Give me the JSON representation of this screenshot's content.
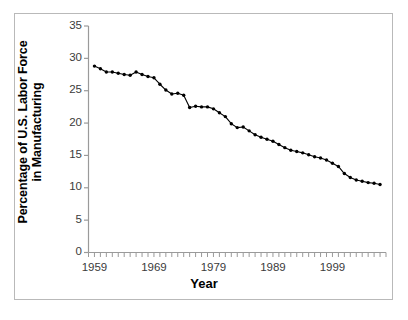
{
  "figure": {
    "background": "#ffffff",
    "border_color": "#b9b9b9"
  },
  "axis_titles": {
    "y_line1": "Percentage of U.S. Labor Force",
    "y_line2": "in Manufacturing",
    "x": "Year"
  },
  "chart_data": {
    "type": "line",
    "title": "",
    "subtitle": "",
    "xlabel": "Year",
    "ylabel": "Percentage of U.S. Labor Force in Manufacturing",
    "grid": false,
    "legend": "none",
    "marker": "filled-circle",
    "line_color": "#000000",
    "marker_color": "#000000",
    "xlim": [
      1958,
      2008
    ],
    "ylim": [
      0,
      35
    ],
    "yticks": [
      0,
      5,
      10,
      15,
      20,
      25,
      30,
      35
    ],
    "ytick_labels": [
      "0",
      "5",
      "10",
      "15",
      "20",
      "25",
      "30",
      "35"
    ],
    "xticks": [
      1959,
      1969,
      1979,
      1989,
      1999
    ],
    "xtick_labels": [
      "1959",
      "1969",
      "1979",
      "1989",
      "1999"
    ],
    "x_minor_tick_interval": 1,
    "x": [
      1959,
      1960,
      1961,
      1962,
      1963,
      1964,
      1965,
      1966,
      1967,
      1968,
      1969,
      1970,
      1971,
      1972,
      1973,
      1974,
      1975,
      1976,
      1977,
      1978,
      1979,
      1980,
      1981,
      1982,
      1983,
      1984,
      1985,
      1986,
      1987,
      1988,
      1989,
      1990,
      1991,
      1992,
      1993,
      1994,
      1995,
      1996,
      1997,
      1998,
      1999,
      2000,
      2001,
      2002,
      2003,
      2004,
      2005,
      2006,
      2007
    ],
    "values": [
      28.8,
      28.4,
      27.9,
      27.9,
      27.7,
      27.5,
      27.4,
      27.9,
      27.5,
      27.2,
      27.0,
      26.0,
      25.1,
      24.5,
      24.6,
      24.3,
      22.4,
      22.6,
      22.5,
      22.5,
      22.2,
      21.6,
      21.0,
      19.9,
      19.3,
      19.4,
      18.8,
      18.2,
      17.8,
      17.5,
      17.2,
      16.7,
      16.2,
      15.8,
      15.6,
      15.4,
      15.1,
      14.8,
      14.6,
      14.3,
      13.8,
      13.3,
      12.2,
      11.6,
      11.2,
      11.0,
      10.8,
      10.7,
      10.5
    ],
    "annotations": []
  }
}
